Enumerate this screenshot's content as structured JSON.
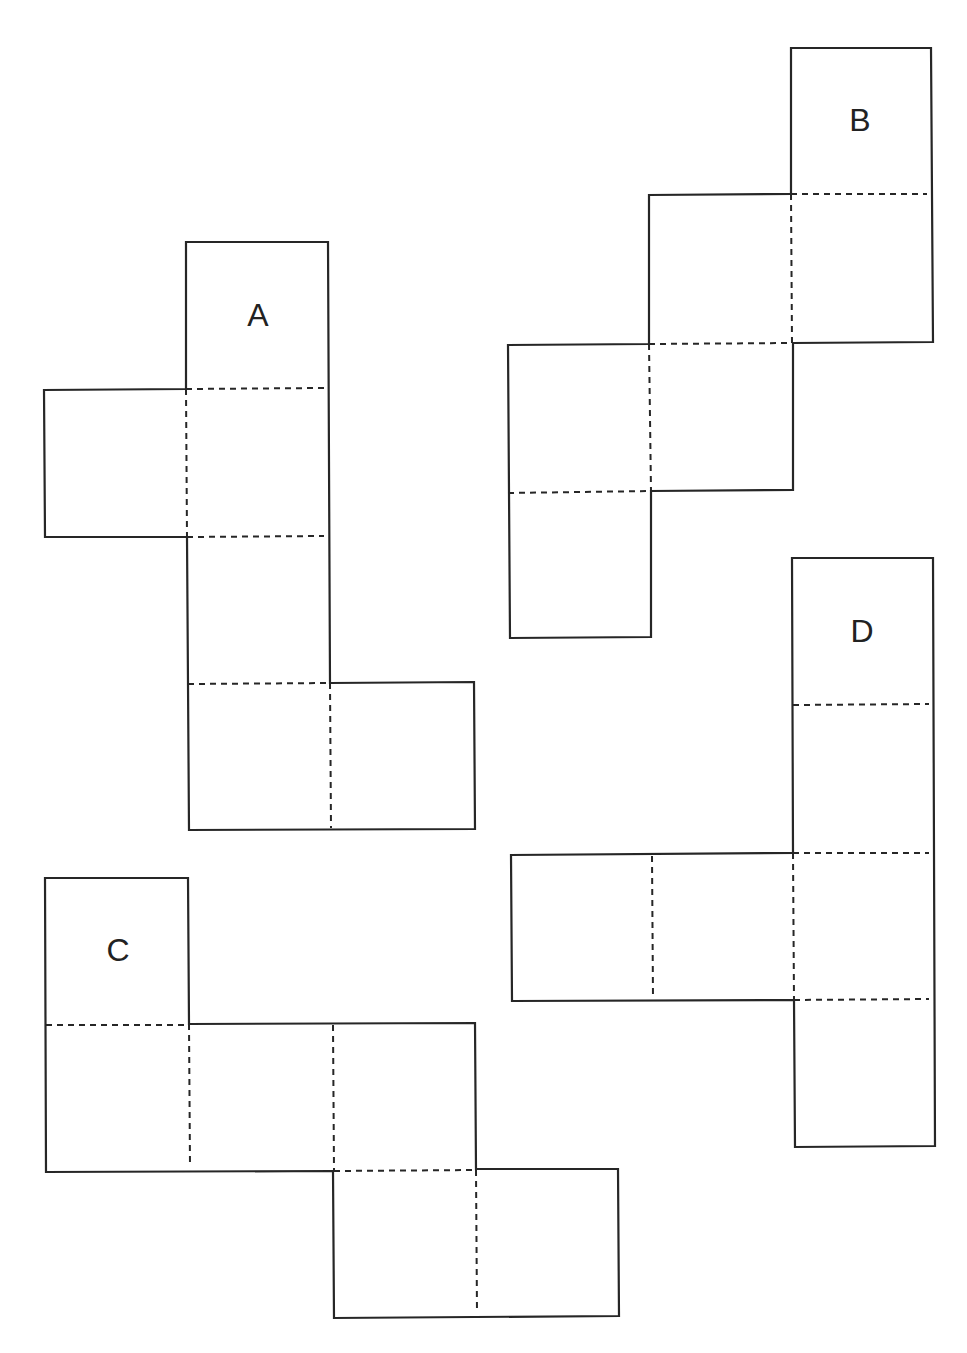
{
  "diagram": {
    "type": "cube-nets",
    "stroke_color": "#262626",
    "background": "#ffffff",
    "nets": [
      {
        "id": "A",
        "label": "A",
        "label_pos": [
          258,
          318
        ],
        "outline": [
          [
            186,
            242
          ],
          [
            328,
            242
          ],
          [
            330,
            683
          ],
          [
            474,
            682
          ],
          [
            475,
            829
          ],
          [
            189,
            830
          ],
          [
            187,
            537
          ],
          [
            45,
            537
          ],
          [
            44,
            390
          ],
          [
            186,
            389
          ]
        ],
        "folds": [
          [
            [
              186,
              389
            ],
            [
              324,
              388
            ]
          ],
          [
            [
              186,
              389
            ],
            [
              187,
              537
            ]
          ],
          [
            [
              187,
              537
            ],
            [
              324,
              536
            ]
          ],
          [
            [
              188,
              684
            ],
            [
              330,
              683
            ]
          ],
          [
            [
              330,
              683
            ],
            [
              331,
              828
            ]
          ]
        ]
      },
      {
        "id": "B",
        "label": "B",
        "label_pos": [
          860,
          123
        ],
        "outline": [
          [
            791,
            48
          ],
          [
            931,
            48
          ],
          [
            933,
            342
          ],
          [
            793,
            343
          ],
          [
            793,
            490
          ],
          [
            651,
            491
          ],
          [
            651,
            637
          ],
          [
            510,
            638
          ],
          [
            508,
            345
          ],
          [
            649,
            344
          ],
          [
            649,
            195
          ],
          [
            791,
            194
          ]
        ],
        "folds": [
          [
            [
              791,
              194
            ],
            [
              927,
              194
            ]
          ],
          [
            [
              791,
              194
            ],
            [
              792,
              343
            ]
          ],
          [
            [
              649,
              344
            ],
            [
              793,
              343
            ]
          ],
          [
            [
              649,
              344
            ],
            [
              651,
              491
            ]
          ],
          [
            [
              508,
              493
            ],
            [
              651,
              491
            ]
          ]
        ]
      },
      {
        "id": "C",
        "label": "C",
        "label_pos": [
          118,
          953
        ],
        "outline": [
          [
            45,
            878
          ],
          [
            188,
            878
          ],
          [
            189,
            1024
          ],
          [
            475,
            1023
          ],
          [
            476,
            1169
          ],
          [
            618,
            1169
          ],
          [
            619,
            1316
          ],
          [
            334,
            1318
          ],
          [
            333,
            1171
          ],
          [
            46,
            1172
          ]
        ],
        "folds": [
          [
            [
              46,
              1025
            ],
            [
              188,
              1025
            ]
          ],
          [
            [
              189,
              1024
            ],
            [
              190,
              1165
            ]
          ],
          [
            [
              333,
              1025
            ],
            [
              334,
              1170
            ]
          ],
          [
            [
              334,
              1171
            ],
            [
              476,
              1170
            ]
          ],
          [
            [
              476,
              1170
            ],
            [
              477,
              1312
            ]
          ]
        ]
      },
      {
        "id": "D",
        "label": "D",
        "label_pos": [
          862,
          634
        ],
        "outline": [
          [
            792,
            558
          ],
          [
            933,
            558
          ],
          [
            935,
            1146
          ],
          [
            795,
            1147
          ],
          [
            794,
            1000
          ],
          [
            512,
            1001
          ],
          [
            511,
            855
          ],
          [
            793,
            853
          ]
        ],
        "folds": [
          [
            [
              793,
              705
            ],
            [
              929,
              704
            ]
          ],
          [
            [
              793,
              853
            ],
            [
              929,
              853
            ]
          ],
          [
            [
              794,
              1000
            ],
            [
              929,
              999
            ]
          ],
          [
            [
              652,
              856
            ],
            [
              653,
              997
            ]
          ],
          [
            [
              793,
              853
            ],
            [
              794,
              1000
            ]
          ]
        ]
      }
    ]
  }
}
